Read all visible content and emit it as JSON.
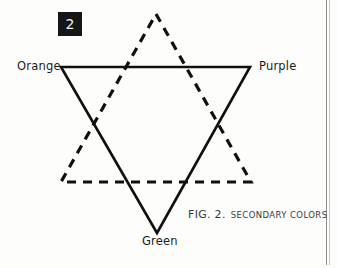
{
  "figure": {
    "step_badge": "2",
    "caption_label": "FIG. 2.",
    "caption_title": "SECONDARY COLORS",
    "vertex_labels": {
      "orange": "Orange",
      "purple": "Purple",
      "green": "Green"
    },
    "colors": {
      "ink": "#101010",
      "badge_background": "#15161a",
      "badge_text": "#f2f2f2",
      "caption_text": "#3a3a3a",
      "page_rule": "#8d8d8d",
      "background": "#fdfdfc"
    }
  },
  "diagram_data": {
    "type": "diagram",
    "description": "Hexagram of two overlapping equilateral triangles illustrating secondary colors",
    "shapes": [
      {
        "name": "downward-triangle",
        "stroke": "solid",
        "stroke_width": 2.6,
        "points": "61,67 250,67 157,233",
        "labeled_vertices": [
          "Orange",
          "Purple",
          "Green"
        ]
      },
      {
        "name": "upward-triangle",
        "stroke": "dashed",
        "stroke_width": 3.2,
        "dash_pattern": "9 7",
        "points": "156,14 251,182 61,182",
        "labeled_vertices": []
      }
    ]
  }
}
